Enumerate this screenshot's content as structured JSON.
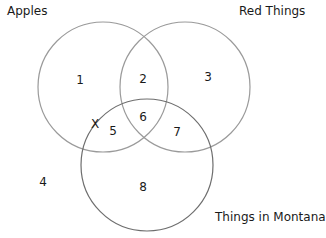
{
  "sets": [
    {
      "label": "Apples",
      "cx": 103,
      "cy": 87,
      "r": 65,
      "stroke": "#9a9a9a"
    },
    {
      "label": "Red Things",
      "cx": 185,
      "cy": 87,
      "r": 65,
      "stroke": "#9a9a9a"
    },
    {
      "label": "Things in Montana",
      "cx": 147,
      "cy": 165,
      "r": 66,
      "stroke": "#6e6e6e"
    }
  ],
  "regions": [
    {
      "id": "1",
      "x": 80,
      "y": 80
    },
    {
      "id": "2",
      "x": 143,
      "y": 79
    },
    {
      "id": "3",
      "x": 208,
      "y": 77
    },
    {
      "id": "4",
      "x": 43,
      "y": 182
    },
    {
      "id": "5",
      "x": 113,
      "y": 131
    },
    {
      "id": "6",
      "x": 143,
      "y": 117
    },
    {
      "id": "7",
      "x": 177,
      "y": 132
    },
    {
      "id": "8",
      "x": 143,
      "y": 187
    }
  ],
  "marker": {
    "symbol": "X",
    "x": 95,
    "y": 124
  }
}
